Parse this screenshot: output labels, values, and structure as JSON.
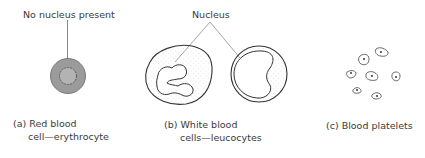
{
  "panels": {
    "red": {
      "annotation": "No nucleus present",
      "caption_line1": "(a) Red blood",
      "caption_line2": "cell—erythrocyte"
    },
    "white": {
      "annotation": "Nucleus",
      "caption_line1": "(b) White blood",
      "caption_line2": "cells—leucocytes"
    },
    "platelets": {
      "caption": "(c) Blood platelets",
      "count": 7
    }
  },
  "colors": {
    "stroke": "#3a3a3a",
    "rbc_fill": "#9a9a9a",
    "rbc_center": "#b5b5b5",
    "stipple": "#bdbdbd"
  }
}
